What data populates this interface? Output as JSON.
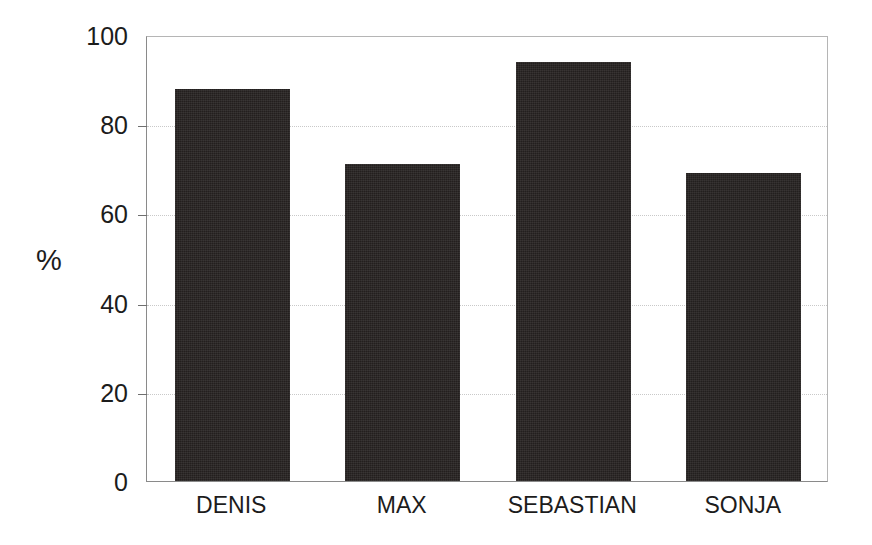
{
  "chart_data": {
    "type": "bar",
    "title": "",
    "xlabel": "",
    "ylabel": "%",
    "categories": [
      "DENIS",
      "MAX",
      "SEBASTIAN",
      "SONJA"
    ],
    "values": [
      88,
      71,
      94,
      69
    ],
    "ylim": [
      0,
      100
    ],
    "yticks": [
      0,
      20,
      40,
      60,
      80,
      100
    ],
    "ytick_labels": [
      "0",
      "20",
      "40",
      "60",
      "80",
      "100"
    ],
    "grid": "horizontal-dotted",
    "legend": "none",
    "bar_color": "#231f1e",
    "grid_color": "#c9c9c9",
    "axis_color": "#8a8a8a",
    "text_color": "#1c1c1c",
    "background": "#ffffff"
  }
}
